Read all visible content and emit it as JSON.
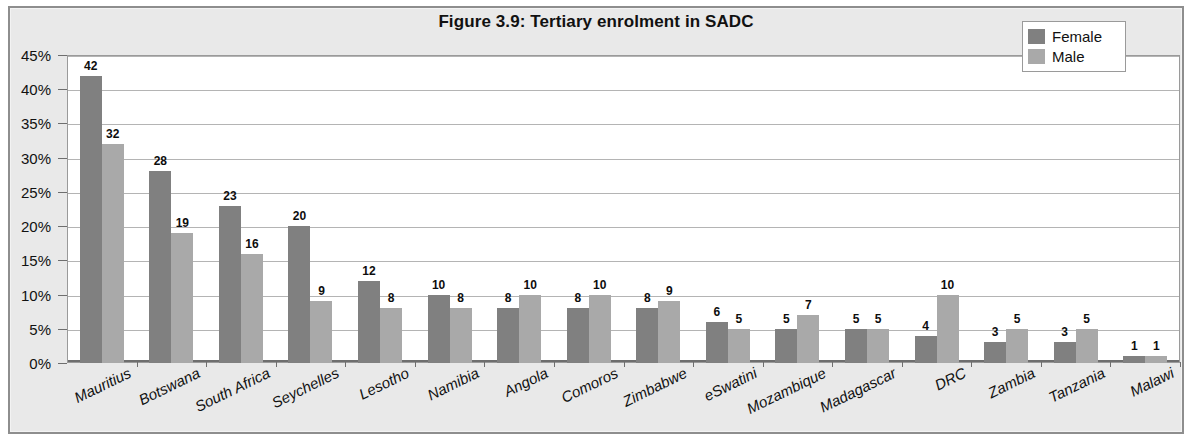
{
  "figure": {
    "title": "Figure 3.9: Tertiary enrolment in SADC"
  },
  "legend": {
    "position": "top-right",
    "entries": [
      {
        "label": "Female",
        "color": "#808080"
      },
      {
        "label": "Male",
        "color": "#a9a9a9"
      }
    ]
  },
  "axes": {
    "y_tick_labels": [
      "45%",
      "40%",
      "35%",
      "30%",
      "25%",
      "20%",
      "15%",
      "10%",
      "5%",
      "0%"
    ],
    "y_tick_values": [
      45,
      40,
      35,
      30,
      25,
      20,
      15,
      10,
      5,
      0
    ]
  },
  "chart_data": {
    "type": "bar",
    "title": "Figure 3.9: Tertiary enrolment in SADC",
    "xlabel": "",
    "ylabel": "",
    "ylim": [
      0,
      45
    ],
    "grid": true,
    "legend_position": "top-right",
    "categories": [
      "Mauritius",
      "Botswana",
      "South Africa",
      "Seychelles",
      "Lesotho",
      "Namibia",
      "Angola",
      "Comoros",
      "Zimbabwe",
      "eSwatini",
      "Mozambique",
      "Madagascar",
      "DRC",
      "Zambia",
      "Tanzania",
      "Malawi"
    ],
    "series": [
      {
        "name": "Female",
        "color": "#808080",
        "values": [
          42,
          28,
          23,
          20,
          12,
          10,
          8,
          8,
          8,
          6,
          5,
          5,
          4,
          3,
          3,
          1
        ]
      },
      {
        "name": "Male",
        "color": "#a9a9a9",
        "values": [
          32,
          19,
          16,
          9,
          8,
          8,
          10,
          10,
          9,
          5,
          7,
          5,
          10,
          5,
          5,
          1
        ]
      }
    ],
    "data_labels": true,
    "value_unit": "%"
  }
}
